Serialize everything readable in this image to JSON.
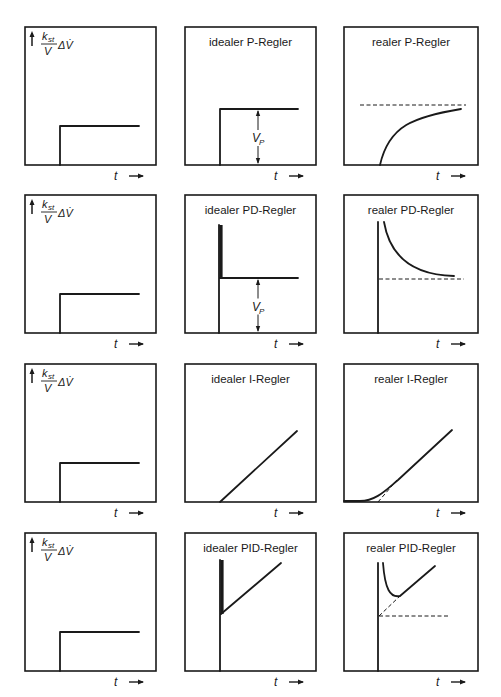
{
  "figure": {
    "input_label": {
      "numerator": "k",
      "numerator_sub": "st",
      "denominator": "V",
      "suffix": "ΔV̇",
      "arrow_icon": "up-arrow-icon"
    },
    "time_label": "t",
    "time_arrow_icon": "right-arrow-icon",
    "vp_label": "V",
    "vp_sub": "P"
  },
  "rows": [
    {
      "name": "P",
      "panels": [
        {
          "title": "",
          "kind": "input-step"
        },
        {
          "title": "idealer P-Regler",
          "kind": "ideal-P"
        },
        {
          "title": "realer P-Regler",
          "kind": "real-P"
        }
      ]
    },
    {
      "name": "PD",
      "panels": [
        {
          "title": "",
          "kind": "input-step"
        },
        {
          "title": "idealer PD-Regler",
          "kind": "ideal-PD"
        },
        {
          "title": "realer PD-Regler",
          "kind": "real-PD"
        }
      ]
    },
    {
      "name": "I",
      "panels": [
        {
          "title": "",
          "kind": "input-step"
        },
        {
          "title": "idealer I-Regler",
          "kind": "ideal-I"
        },
        {
          "title": "realer I-Regler",
          "kind": "real-I"
        }
      ]
    },
    {
      "name": "PID",
      "panels": [
        {
          "title": "",
          "kind": "input-step"
        },
        {
          "title": "idealer PID-Regler",
          "kind": "ideal-PID"
        },
        {
          "title": "realer PID-Regler",
          "kind": "real-PID"
        }
      ]
    }
  ],
  "layout": {
    "col_x": [
      25,
      185,
      344
    ],
    "col_w": [
      131,
      131,
      134
    ],
    "row_y": [
      27,
      195,
      364,
      533
    ],
    "row_h": 138
  },
  "colors": {
    "ink": "#1a1a1a",
    "paper": "#ffffff"
  }
}
